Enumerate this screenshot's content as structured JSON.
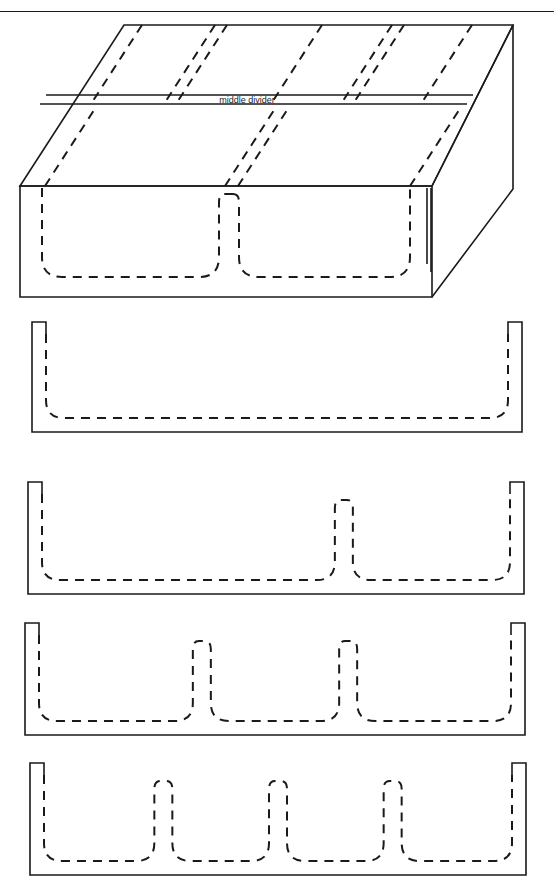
{
  "document": {
    "type": "technical-drawing",
    "subject": "partitioned tray / mold cavity cross-sections",
    "header_fragment": "",
    "top_rule": true
  },
  "isometric": {
    "label": "middle divider",
    "label_x": 247,
    "label_y": 101,
    "description": "3D isometric view of a rectangular tray showing hidden cavity outlines as dashed lines and a middle divider band across the top face",
    "top_face": {
      "back_left": [
        124,
        25
      ],
      "back_right": [
        513,
        25
      ],
      "front_right": [
        432,
        186
      ],
      "front_left": [
        20,
        186
      ]
    },
    "front_face": {
      "top_left": [
        20,
        186
      ],
      "top_right": [
        432,
        186
      ],
      "bottom_right": [
        432,
        297
      ],
      "bottom_left": [
        20,
        297
      ]
    },
    "right_face": {
      "top_back": [
        513,
        25
      ],
      "top_front": [
        432,
        186
      ],
      "bottom_front": [
        432,
        297
      ],
      "bottom_back": [
        513,
        189
      ]
    },
    "divider_band": {
      "left_x": 46,
      "right_x": 473,
      "top_y": 95,
      "bottom_y": 104
    },
    "top_dashed_rear": [
      142,
      215,
      227,
      322,
      392,
      404,
      472
    ],
    "top_dashed_front": [
      45,
      225,
      238,
      410
    ],
    "front_cavities": 2,
    "front_divider_x": 228
  },
  "sections": [
    {
      "id": "section-1",
      "name": "one-compartment-profile",
      "compartments": 1,
      "dividers": 0,
      "outer": {
        "x": 32,
        "y": 322,
        "width": 490,
        "height": 110
      },
      "wall_thickness": 14,
      "rim_height": 12,
      "floor_thickness": 14,
      "corner_radius": 18,
      "divider_positions": []
    },
    {
      "id": "section-2",
      "name": "two-compartment-profile",
      "compartments": 2,
      "dividers": 1,
      "outer": {
        "x": 28,
        "y": 482,
        "width": 496,
        "height": 112
      },
      "wall_thickness": 14,
      "rim_height": 12,
      "floor_thickness": 14,
      "corner_radius": 18,
      "divider_positions": [
        0.645
      ]
    },
    {
      "id": "section-3",
      "name": "three-compartment-profile",
      "compartments": 3,
      "dividers": 2,
      "outer": {
        "x": 25,
        "y": 623,
        "width": 500,
        "height": 112
      },
      "wall_thickness": 14,
      "rim_height": 12,
      "floor_thickness": 14,
      "corner_radius": 18,
      "divider_positions": [
        0.345,
        0.655
      ]
    },
    {
      "id": "section-4",
      "name": "four-compartment-profile",
      "compartments": 4,
      "dividers": 3,
      "outer": {
        "x": 30,
        "y": 763,
        "width": 496,
        "height": 112
      },
      "wall_thickness": 14,
      "rim_height": 12,
      "floor_thickness": 14,
      "corner_radius": 18,
      "divider_positions": [
        0.255,
        0.5,
        0.745
      ]
    }
  ],
  "style": {
    "line_color": "#1a1a1a",
    "solid_width": 1.6,
    "dash_width": 2.0,
    "dash_pattern": "9 7",
    "background": "#ffffff"
  }
}
